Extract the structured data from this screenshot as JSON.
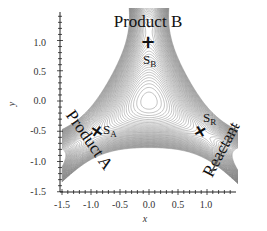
{
  "chart_data": {
    "type": "contour",
    "title": "",
    "xlabel": "x",
    "ylabel": "y",
    "xlim": [
      -1.5,
      1.5
    ],
    "ylim": [
      -1.5,
      1.4
    ],
    "x_ticks": [
      "-1.5",
      "-1.0",
      "-0.5",
      "0.0",
      "0.5",
      "1.0"
    ],
    "y_ticks": [
      "-1.5",
      "-1.0",
      "-0.5",
      "0.0",
      "0.5",
      "1.0"
    ],
    "grid": false,
    "channels": [
      {
        "name": "Product B",
        "direction": "up"
      },
      {
        "name": "Product A",
        "direction": "lower-left"
      },
      {
        "name": "Reactant",
        "direction": "lower-right"
      }
    ],
    "points": [
      {
        "label": "S",
        "subscript": "B",
        "x": 0.0,
        "y": 1.0
      },
      {
        "label": "S",
        "subscript": "A",
        "x": -0.87,
        "y": -0.5
      },
      {
        "label": "S",
        "subscript": "R",
        "x": 0.87,
        "y": -0.5
      }
    ],
    "annotations": [
      "Product B",
      "Product A",
      "Reactant"
    ],
    "contour_color": "#7a7a7a"
  },
  "labels": {
    "product_b": "Product B",
    "product_a": "Product A",
    "reactant": "Reactant",
    "sb_main": "S",
    "sb_sub": "B",
    "sa_main": "S",
    "sa_sub": "A",
    "sr_main": "S",
    "sr_sub": "R",
    "x_axis": "x",
    "y_axis": "y",
    "x_ticks": [
      "-1.5",
      "-1.0",
      "-0.5",
      "0.0",
      "0.5",
      "1.0"
    ],
    "y_ticks": [
      "-1.5",
      "-1.0",
      "-0.5",
      "0.0",
      "0.5",
      "1.0"
    ]
  }
}
